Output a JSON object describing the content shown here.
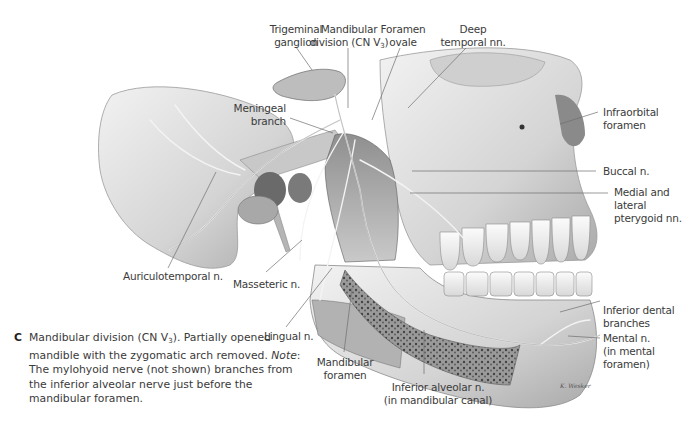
{
  "figure": {
    "panel_letter": "C",
    "caption_part1": "Mandibular division (CN V",
    "caption_sub": "3",
    "caption_part2": "). Partially opened mandible with the zygomatic arch removed. ",
    "caption_note_label": "Note",
    "caption_part3": ": The mylohyoid nerve (not shown) branches from the inferior alveolar nerve just before the mandibular foramen.",
    "artist_signature": "K. Wesker"
  },
  "labels": {
    "trigeminal_ganglion": [
      "Trigeminal",
      "ganglion"
    ],
    "mandibular_division": [
      "Mandibular",
      "division (CN V",
      "3",
      ")"
    ],
    "foramen_ovale": [
      "Foramen",
      "ovale"
    ],
    "deep_temporal": [
      "Deep",
      "temporal nn."
    ],
    "meningeal_branch": [
      "Meningeal",
      "branch"
    ],
    "infraorbital_foramen": [
      "Infraorbital",
      "foramen"
    ],
    "buccal": "Buccal n.",
    "pterygoid": [
      "Medial and",
      "lateral",
      "pterygoid nn."
    ],
    "auriculotemporal": "Auriculotemporal n.",
    "masseteric": "Masseteric n.",
    "lingual": "Lingual n.",
    "mandibular_foramen": [
      "Mandibular",
      "foramen"
    ],
    "inferior_alveolar": [
      "Inferior alveolar n.",
      "(in mandibular canal)"
    ],
    "inferior_dental": [
      "Inferior dental",
      "branches"
    ],
    "mental": [
      "Mental n.",
      "(in mental",
      "foramen)"
    ]
  },
  "colors": {
    "bone_light": "#e9e9e9",
    "bone_mid": "#bdbdbd",
    "bone_dark": "#7a7a7a",
    "leader": "#6e6e6e"
  }
}
